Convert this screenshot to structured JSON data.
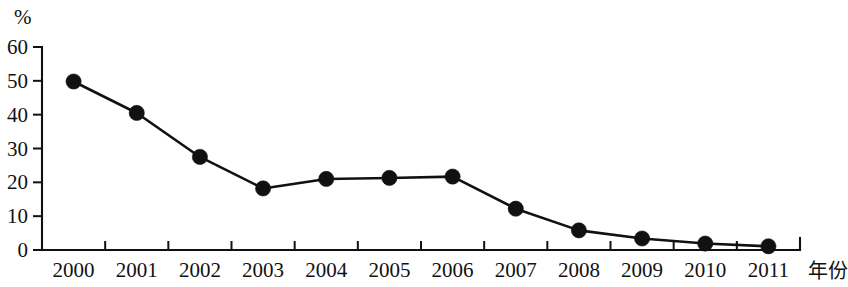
{
  "chart_data": {
    "type": "line",
    "title": "",
    "subtitle": "",
    "xlabel": "年份",
    "ylabel": "%",
    "ylim": [
      0,
      60
    ],
    "yticks": [
      0,
      10,
      20,
      30,
      40,
      50,
      60
    ],
    "ytick_labels": [
      "0",
      "10",
      "20",
      "30",
      "40",
      "50",
      "60"
    ],
    "grid": false,
    "legend": "none",
    "marker": "filled-circle",
    "line_color": "#111111",
    "marker_color": "#111111",
    "categories": [
      "2000",
      "2001",
      "2002",
      "2003",
      "2004",
      "2005",
      "2006",
      "2007",
      "2008",
      "2009",
      "2010",
      "2011"
    ],
    "values": [
      49.8,
      40.5,
      27.5,
      18.2,
      21.0,
      21.3,
      21.7,
      12.2,
      5.8,
      3.4,
      1.9,
      1.1
    ],
    "series": [
      {
        "name": "",
        "values": [
          49.8,
          40.5,
          27.5,
          18.2,
          21.0,
          21.3,
          21.7,
          12.2,
          5.8,
          3.4,
          1.9,
          1.1
        ]
      }
    ]
  },
  "axes": {
    "y_unit_label": "%",
    "x_axis_label": "年份"
  }
}
